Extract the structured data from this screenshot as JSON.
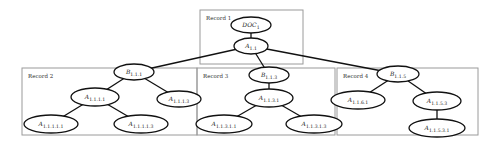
{
  "diagram": {
    "title": "",
    "records": [
      {
        "id": "record-1",
        "label": "Record 1",
        "x": 200,
        "y": 10,
        "w": 103,
        "h": 54
      },
      {
        "id": "record-2",
        "label": "Record 2",
        "x": 22,
        "y": 68,
        "w": 175,
        "h": 67
      },
      {
        "id": "record-3",
        "label": "Record 3",
        "x": 197,
        "y": 68,
        "w": 138,
        "h": 67
      },
      {
        "id": "record-4",
        "label": "Record 4",
        "x": 337,
        "y": 68,
        "w": 141,
        "h": 67
      }
    ],
    "nodes": [
      {
        "id": "doc1",
        "base": "DOC",
        "sub": "1",
        "cx": 251,
        "cy": 25,
        "rx": 20,
        "ry": 8
      },
      {
        "id": "a11",
        "base": "A",
        "sub": "1.1",
        "cx": 251,
        "cy": 46,
        "rx": 17,
        "ry": 8
      },
      {
        "id": "b111",
        "base": "B",
        "sub": "1.1.1",
        "cx": 134,
        "cy": 72,
        "rx": 20,
        "ry": 8
      },
      {
        "id": "a1111",
        "base": "A",
        "sub": "1.1.1.1",
        "cx": 95,
        "cy": 97,
        "rx": 24,
        "ry": 9
      },
      {
        "id": "a1113",
        "base": "A",
        "sub": "1.1.1.3",
        "cx": 179,
        "cy": 99,
        "rx": 22,
        "ry": 8
      },
      {
        "id": "a11111",
        "base": "A",
        "sub": "1.1.1.1.1",
        "cx": 51,
        "cy": 124,
        "rx": 27,
        "ry": 9
      },
      {
        "id": "a11113",
        "base": "A",
        "sub": "1.1.1.1.3",
        "cx": 141,
        "cy": 124,
        "rx": 27,
        "ry": 9
      },
      {
        "id": "b113",
        "base": "B",
        "sub": "1.1.3",
        "cx": 269,
        "cy": 75,
        "rx": 20,
        "ry": 8
      },
      {
        "id": "a1131",
        "base": "A",
        "sub": "1.1.3.1",
        "cx": 269,
        "cy": 98,
        "rx": 24,
        "ry": 9
      },
      {
        "id": "a11311",
        "base": "A",
        "sub": "1.1.3.1.1",
        "cx": 224,
        "cy": 124,
        "rx": 28,
        "ry": 9
      },
      {
        "id": "a11313",
        "base": "A",
        "sub": "1.1.3.1.3",
        "cx": 314,
        "cy": 124,
        "rx": 28,
        "ry": 9
      },
      {
        "id": "b115",
        "base": "B",
        "sub": "1.1.5",
        "cx": 398,
        "cy": 74,
        "rx": 21,
        "ry": 8
      },
      {
        "id": "a1161",
        "base": "A",
        "sub": "1.1.6.1",
        "cx": 358,
        "cy": 100,
        "rx": 27,
        "ry": 9
      },
      {
        "id": "a1153",
        "base": "A",
        "sub": "1.1.5.3",
        "cx": 437,
        "cy": 101,
        "rx": 24,
        "ry": 9
      },
      {
        "id": "a11531",
        "base": "A",
        "sub": "1.1.5.3.1",
        "cx": 437,
        "cy": 128,
        "rx": 28,
        "ry": 9
      }
    ],
    "edges": [
      {
        "from": "doc1",
        "to": "a11"
      },
      {
        "from": "a11",
        "to": "b111"
      },
      {
        "from": "a11",
        "to": "b113"
      },
      {
        "from": "a11",
        "to": "b115"
      },
      {
        "from": "b111",
        "to": "a1111"
      },
      {
        "from": "b111",
        "to": "a1113"
      },
      {
        "from": "a1111",
        "to": "a11111"
      },
      {
        "from": "a1111",
        "to": "a11113"
      },
      {
        "from": "b113",
        "to": "a1131"
      },
      {
        "from": "a1131",
        "to": "a11311"
      },
      {
        "from": "a1131",
        "to": "a11313"
      },
      {
        "from": "b115",
        "to": "a1161"
      },
      {
        "from": "b115",
        "to": "a1153"
      },
      {
        "from": "a1153",
        "to": "a11531"
      }
    ]
  }
}
